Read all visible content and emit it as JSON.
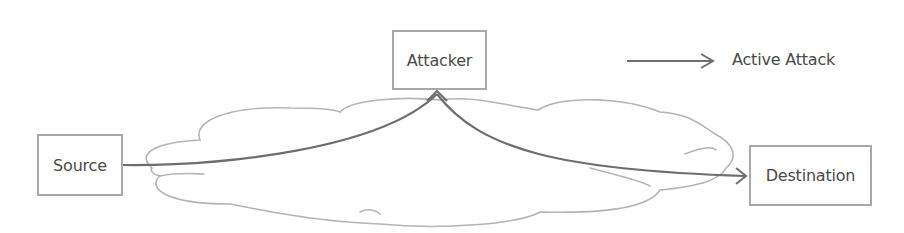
{
  "diagram": {
    "type": "network-attack-diagram",
    "nodes": {
      "source": {
        "label": "Source"
      },
      "attacker": {
        "label": "Attacker"
      },
      "destination": {
        "label": "Destination"
      }
    },
    "edges": [
      {
        "from": "Source",
        "to": "Attacker",
        "style": "solid",
        "arrowhead": "open"
      },
      {
        "from": "Attacker",
        "to": "Destination",
        "style": "solid",
        "arrowhead": "open"
      }
    ],
    "background_shape": "cloud",
    "legend": {
      "items": [
        {
          "symbol": "arrow",
          "label": "Active Attack"
        }
      ]
    },
    "colors": {
      "box_border": "#a8a8a8",
      "cloud_stroke": "#b4b4b4",
      "edge": "#6e6e6e",
      "text": "#4a4a4a"
    }
  }
}
